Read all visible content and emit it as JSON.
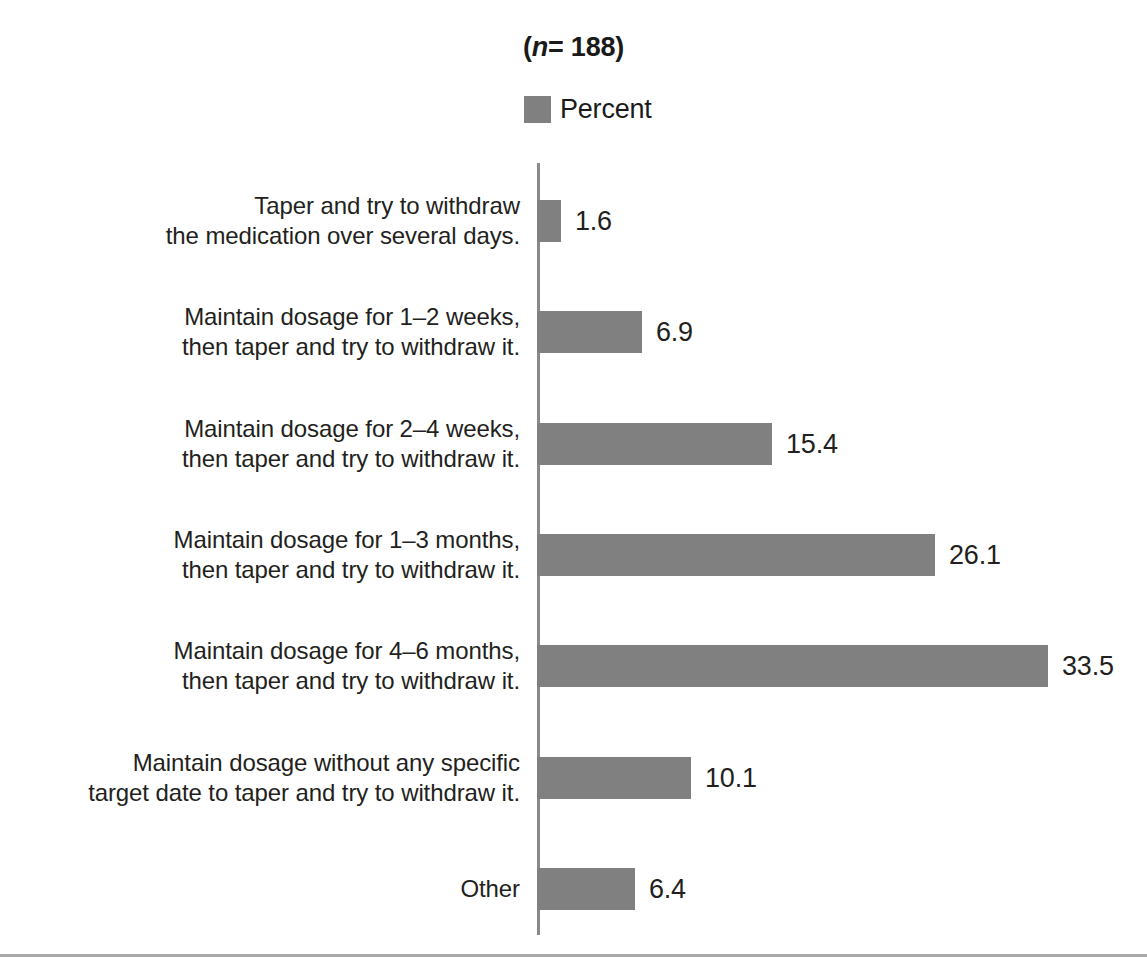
{
  "chart_data": {
    "type": "bar",
    "orientation": "horizontal",
    "title": "(n= 188)",
    "title_prefix": "(",
    "title_italic": "n",
    "title_suffix": "= 188)",
    "xlabel": "",
    "ylabel": "",
    "xlim": [
      0,
      33.5
    ],
    "grid": false,
    "legend_position": "top-center",
    "legend": [
      "Percent"
    ],
    "series_name": "Percent",
    "bar_color": "#808080",
    "axis_color": "#8a8a8a",
    "text_color": "#231f20",
    "categories": [
      "Taper and try to withdraw\nthe medication over several days.",
      "Maintain dosage for 1–2 weeks,\nthen taper and try to withdraw it.",
      "Maintain dosage for 2–4 weeks,\nthen taper and try to withdraw it.",
      "Maintain dosage for 1–3 months,\nthen taper and try to withdraw it.",
      "Maintain dosage for 4–6 months,\nthen taper and try to withdraw it.",
      "Maintain dosage without any specific\ntarget date to taper and try to withdraw it.",
      "Other"
    ],
    "values": [
      1.6,
      6.9,
      15.4,
      26.1,
      33.5,
      10.1,
      6.4
    ],
    "value_labels": [
      "1.6",
      "6.9",
      "15.4",
      "26.1",
      "33.5",
      "10.1",
      "6.4"
    ]
  },
  "rows": [
    {
      "label": "Taper and try to withdraw\nthe medication over several days.",
      "value_label": "1.6"
    },
    {
      "label": "Maintain dosage for 1–2 weeks,\nthen taper and try to withdraw it.",
      "value_label": "6.9"
    },
    {
      "label": "Maintain dosage for 2–4 weeks,\nthen taper and try to withdraw it.",
      "value_label": "15.4"
    },
    {
      "label": "Maintain dosage for 1–3 months,\nthen taper and try to withdraw it.",
      "value_label": "26.1"
    },
    {
      "label": "Maintain dosage for 4–6 months,\nthen taper and try to withdraw it.",
      "value_label": "33.5"
    },
    {
      "label": "Maintain dosage without any specific\ntarget date to taper and try to withdraw it.",
      "value_label": "10.1"
    },
    {
      "label": "Other",
      "value_label": "6.4"
    }
  ],
  "legend": {
    "label": "Percent"
  },
  "title": {
    "prefix": "(",
    "italic": "n",
    "suffix": "= 188)"
  }
}
